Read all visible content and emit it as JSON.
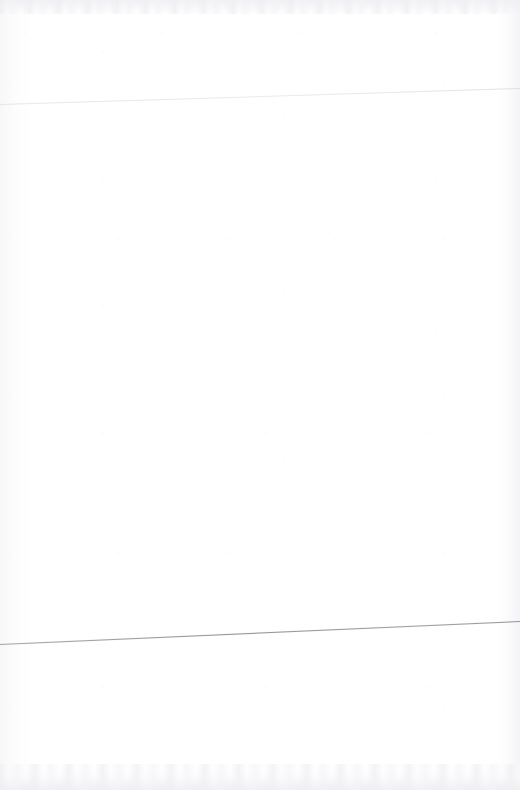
{
  "page": {
    "kind": "scanned-blank-page",
    "width": 520,
    "height": 790,
    "background_color": "#ffffff",
    "body_text": "",
    "header_text": "",
    "footer_text": "",
    "page_number": "",
    "notes": ""
  },
  "rules": {
    "top": {
      "name": "top-rule",
      "color": "#e6e6ea",
      "thickness_px": 1,
      "left_y": 104,
      "right_y": 88,
      "x_start": 0,
      "x_end": 520
    },
    "bottom": {
      "name": "bottom-rule",
      "color": "#9a9aa0",
      "thickness_px": 1,
      "left_y": 644,
      "right_y": 621,
      "x_start": 0,
      "x_end": 520
    }
  },
  "scan_artifacts": {
    "top_band_color": "#eeeef2",
    "bottom_band_color": "#ebebf0",
    "left_margin_tone": "#f6f6f8",
    "right_margin_tone": "#f3f3f6"
  }
}
